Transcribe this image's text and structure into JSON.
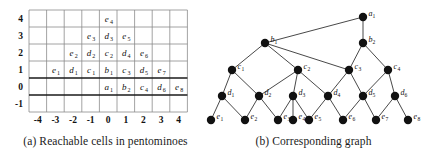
{
  "figure": {
    "panel_a": {
      "caption": "(a) Reachable cells in pentominoes",
      "axis": {
        "x_ticks": [
          "-4",
          "-3",
          "-2",
          "-1",
          "0",
          "1",
          "2",
          "3",
          "4"
        ],
        "y_ticks": [
          "4",
          "3",
          "2",
          "1",
          "0",
          "-1"
        ]
      },
      "cells": [
        {
          "label": "e",
          "sub": "4",
          "x": 0,
          "y": 4
        },
        {
          "label": "e",
          "sub": "3",
          "x": -1,
          "y": 3
        },
        {
          "label": "d",
          "sub": "3",
          "x": 0,
          "y": 3
        },
        {
          "label": "e",
          "sub": "5",
          "x": 1,
          "y": 3
        },
        {
          "label": "e",
          "sub": "2",
          "x": -2,
          "y": 2
        },
        {
          "label": "d",
          "sub": "2",
          "x": -1,
          "y": 2
        },
        {
          "label": "c",
          "sub": "2",
          "x": 0,
          "y": 2
        },
        {
          "label": "d",
          "sub": "4",
          "x": 1,
          "y": 2
        },
        {
          "label": "e",
          "sub": "6",
          "x": 2,
          "y": 2
        },
        {
          "label": "e",
          "sub": "1",
          "x": -3,
          "y": 1
        },
        {
          "label": "d",
          "sub": "1",
          "x": -2,
          "y": 1
        },
        {
          "label": "c",
          "sub": "1",
          "x": -1,
          "y": 1
        },
        {
          "label": "b",
          "sub": "1",
          "x": 0,
          "y": 1
        },
        {
          "label": "c",
          "sub": "3",
          "x": 1,
          "y": 1
        },
        {
          "label": "d",
          "sub": "5",
          "x": 2,
          "y": 1
        },
        {
          "label": "e",
          "sub": "7",
          "x": 3,
          "y": 1
        },
        {
          "label": "a",
          "sub": "1",
          "x": 0,
          "y": 0
        },
        {
          "label": "b",
          "sub": "2",
          "x": 1,
          "y": 0
        },
        {
          "label": "c",
          "sub": "4",
          "x": 2,
          "y": 0
        },
        {
          "label": "d",
          "sub": "6",
          "x": 3,
          "y": 0
        },
        {
          "label": "e",
          "sub": "8",
          "x": 4,
          "y": 0
        }
      ]
    },
    "panel_b": {
      "caption": "(b) Corresponding graph",
      "nodes": [
        {
          "id": "a1",
          "label": "a",
          "sub": "1",
          "cx": 158,
          "cy": 17
        },
        {
          "id": "b1",
          "label": "b",
          "sub": "1",
          "cx": 60,
          "cy": 43
        },
        {
          "id": "b2",
          "label": "b",
          "sub": "2",
          "cx": 158,
          "cy": 43
        },
        {
          "id": "c1",
          "label": "c",
          "sub": "1",
          "cx": 27,
          "cy": 70
        },
        {
          "id": "c2",
          "label": "c",
          "sub": "2",
          "cx": 93,
          "cy": 70
        },
        {
          "id": "c3",
          "label": "c",
          "sub": "3",
          "cx": 144,
          "cy": 70
        },
        {
          "id": "c4",
          "label": "c",
          "sub": "4",
          "cx": 183,
          "cy": 70
        },
        {
          "id": "d1",
          "label": "d",
          "sub": "1",
          "cx": 17,
          "cy": 96
        },
        {
          "id": "d2",
          "label": "d",
          "sub": "2",
          "cx": 54,
          "cy": 96
        },
        {
          "id": "d3",
          "label": "d",
          "sub": "3",
          "cx": 88,
          "cy": 96
        },
        {
          "id": "d4",
          "label": "d",
          "sub": "4",
          "cx": 123,
          "cy": 96
        },
        {
          "id": "d5",
          "label": "d",
          "sub": "5",
          "cx": 158,
          "cy": 96
        },
        {
          "id": "d6",
          "label": "d",
          "sub": "6",
          "cx": 190,
          "cy": 96
        },
        {
          "id": "e1",
          "label": "e",
          "sub": "1",
          "cx": 6,
          "cy": 120
        },
        {
          "id": "e2",
          "label": "e",
          "sub": "2",
          "cx": 40,
          "cy": 120
        },
        {
          "id": "e3",
          "label": "e",
          "sub": "3",
          "cx": 73,
          "cy": 120
        },
        {
          "id": "e4",
          "label": "e",
          "sub": "4",
          "cx": 88,
          "cy": 120
        },
        {
          "id": "e5",
          "label": "e",
          "sub": "5",
          "cx": 104,
          "cy": 120
        },
        {
          "id": "e6",
          "label": "e",
          "sub": "6",
          "cx": 138,
          "cy": 120
        },
        {
          "id": "e7",
          "label": "e",
          "sub": "7",
          "cx": 171,
          "cy": 120
        },
        {
          "id": "e8",
          "label": "e",
          "sub": "8",
          "cx": 203,
          "cy": 120
        }
      ],
      "edges": [
        [
          "a1",
          "b1"
        ],
        [
          "a1",
          "b2"
        ],
        [
          "b1",
          "c1"
        ],
        [
          "b1",
          "c2"
        ],
        [
          "b1",
          "c3"
        ],
        [
          "b2",
          "c3"
        ],
        [
          "b2",
          "c4"
        ],
        [
          "c1",
          "d1"
        ],
        [
          "c1",
          "d2"
        ],
        [
          "c2",
          "d2"
        ],
        [
          "c2",
          "d3"
        ],
        [
          "c2",
          "d4"
        ],
        [
          "c3",
          "d4"
        ],
        [
          "c3",
          "d5"
        ],
        [
          "c4",
          "d5"
        ],
        [
          "c4",
          "d6"
        ],
        [
          "d1",
          "e1"
        ],
        [
          "d1",
          "e2"
        ],
        [
          "d2",
          "e2"
        ],
        [
          "d2",
          "e3"
        ],
        [
          "d3",
          "e3"
        ],
        [
          "d3",
          "e4"
        ],
        [
          "d3",
          "e5"
        ],
        [
          "d4",
          "e5"
        ],
        [
          "d4",
          "e6"
        ],
        [
          "d5",
          "e6"
        ],
        [
          "d5",
          "e7"
        ],
        [
          "d6",
          "e7"
        ],
        [
          "d6",
          "e8"
        ]
      ]
    }
  },
  "style": {
    "node_color": "#111111",
    "edge_color": "#333333",
    "grid_color": "#8c8c8c",
    "axis_color": "#1a1a1a"
  }
}
